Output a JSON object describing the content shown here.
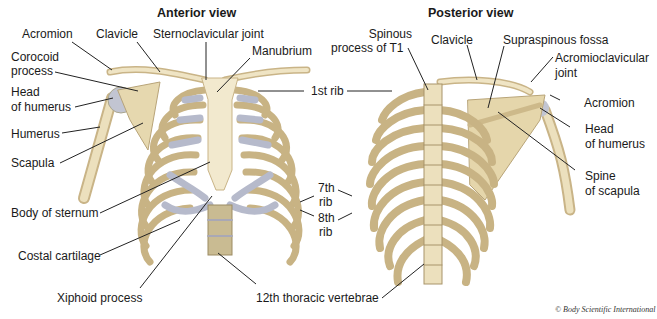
{
  "titles": {
    "anterior": "Anterior view",
    "posterior": "Posterior view"
  },
  "anterior_labels": {
    "acromion": "Acromion",
    "clavicle": "Clavicle",
    "sternoclavicular_joint": "Sternoclavicular joint",
    "manubrium": "Manubrium",
    "corocoid_process_1": "Corocoid",
    "corocoid_process_2": "process",
    "head_of_humerus_1": "Head",
    "head_of_humerus_2": "of humerus",
    "humerus": "Humerus",
    "scapula": "Scapula",
    "body_of_sternum": "Body of sternum",
    "costal_cartilage": "Costal cartilage",
    "xiphoid_process": "Xiphoid process",
    "twelfth_thoracic_vertebrae": "12th thoracic vertebrae"
  },
  "shared_labels": {
    "first_rib": "1st rib",
    "seventh_rib_1": "7th",
    "seventh_rib_2": "rib",
    "eighth_rib_1": "8th",
    "eighth_rib_2": "rib"
  },
  "posterior_labels": {
    "spinous_process_1": "Spinous",
    "spinous_process_2": "process of T1",
    "clavicle": "Clavicle",
    "supraspinous_fossa": "Supraspinous fossa",
    "acromioclavicular_joint_1": "Acromioclavicular",
    "acromioclavicular_joint_2": "joint",
    "acromion": "Acromion",
    "head_of_humerus_1": "Head",
    "head_of_humerus_2": "of humerus",
    "spine_of_scapula_1": "Spine",
    "spine_of_scapula_2": "of scapula"
  },
  "credit": "© Body Scientific International",
  "colors": {
    "bone": "#e8dcb8",
    "bone_shadow": "#b9a67a",
    "cartilage": "#b8bccb",
    "leader": "#222222",
    "text": "#1a1a1a"
  }
}
